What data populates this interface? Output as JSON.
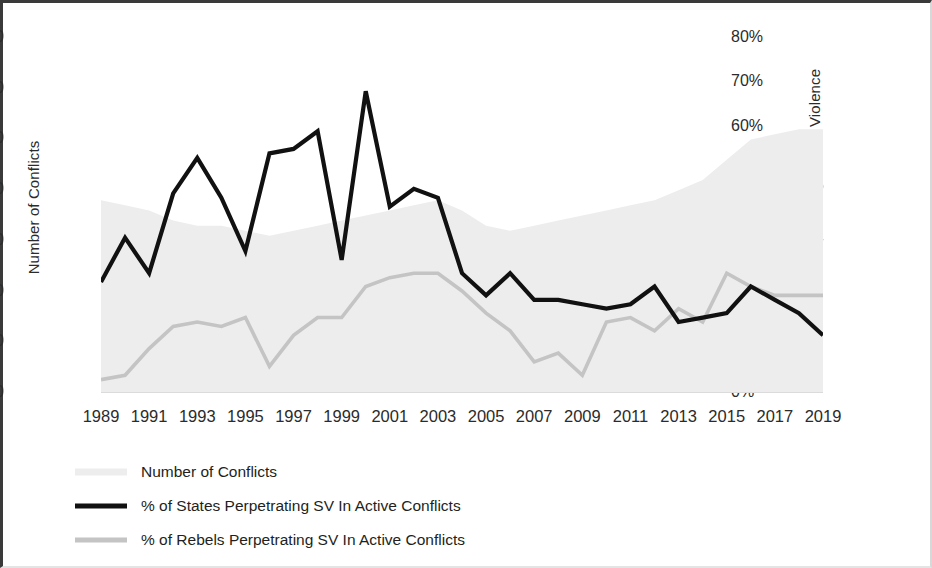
{
  "chart_data": {
    "type": "line",
    "title": "",
    "subtitle": "",
    "xlabel": "",
    "ylabel": "Number of Conflicts",
    "y2label": "% of Actors Perpetrating Sexual Violence",
    "grid": false,
    "legend_position": "bottom-left",
    "x": [
      1989,
      1990,
      1991,
      1992,
      1993,
      1994,
      1995,
      1996,
      1997,
      1998,
      1999,
      2000,
      2001,
      2002,
      2003,
      2004,
      2005,
      2006,
      2007,
      2008,
      2009,
      2010,
      2011,
      2012,
      2013,
      2014,
      2015,
      2016,
      2017,
      2018,
      2019
    ],
    "xticklabels": [
      "1989",
      "1991",
      "1993",
      "1995",
      "1997",
      "1999",
      "2001",
      "2003",
      "2005",
      "2007",
      "2009",
      "2011",
      "2013",
      "2015",
      "2017",
      "2019"
    ],
    "xtickvalues": [
      1989,
      1991,
      1993,
      1995,
      1997,
      1999,
      2001,
      2003,
      2005,
      2007,
      2009,
      2011,
      2013,
      2015,
      2017,
      2019
    ],
    "xlim": [
      1989,
      2019
    ],
    "ylim": [
      0,
      70
    ],
    "yticklabels": [
      "0",
      "10",
      "20",
      "30",
      "40",
      "50",
      "60",
      "70"
    ],
    "ytickvalues": [
      0,
      10,
      20,
      30,
      40,
      50,
      60,
      70
    ],
    "y2lim": [
      0,
      80
    ],
    "y2ticklabels": [
      "0%",
      "10%",
      "20%",
      "30%",
      "40%",
      "50%",
      "60%",
      "70%",
      "80%"
    ],
    "y2tickvalues": [
      0,
      10,
      20,
      30,
      40,
      50,
      60,
      70,
      80
    ],
    "series": [
      {
        "name": "Number of Conflicts",
        "chart_type": "area",
        "axis": "left",
        "color": "#ededed",
        "values": [
          38,
          37,
          36,
          34,
          33,
          33,
          32,
          31,
          32,
          33,
          34,
          35,
          36,
          37,
          38,
          36,
          33,
          32,
          33,
          34,
          35,
          36,
          37,
          38,
          40,
          42,
          46,
          50,
          51,
          52,
          52
        ]
      },
      {
        "name": "% of States Perpetrating SV In Active Conflicts",
        "chart_type": "line",
        "axis": "right",
        "color": "#111111",
        "values": [
          25,
          35,
          27,
          45,
          53,
          44,
          32,
          54,
          55,
          59,
          30,
          68,
          42,
          46,
          44,
          27,
          22,
          27,
          21,
          21,
          20,
          19,
          20,
          24,
          16,
          17,
          18,
          24,
          21,
          18,
          13
        ]
      },
      {
        "name": "% of Rebels Perpetrating SV In Active Conflicts",
        "chart_type": "line",
        "axis": "right",
        "color": "#c4c4c4",
        "values": [
          3,
          4,
          10,
          15,
          16,
          15,
          17,
          6,
          13,
          17,
          17,
          24,
          26,
          27,
          27,
          23,
          18,
          14,
          7,
          9,
          4,
          16,
          17,
          14,
          19,
          16,
          27,
          24,
          22,
          22,
          22
        ]
      }
    ]
  },
  "legend": {
    "items": [
      {
        "label": "Number of Conflicts",
        "swatch": "area-swatch"
      },
      {
        "label": "% of States Perpetrating SV In Active Conflicts",
        "swatch": "states-line-swatch"
      },
      {
        "label": "% of Rebels Perpetrating SV In Active Conflicts",
        "swatch": "rebels-line-swatch"
      }
    ]
  },
  "colors": {
    "area": "#ededed",
    "states_line": "#111111",
    "rebels_line": "#c4c4c4",
    "text": "#231f20",
    "frame": "#3a3a3a"
  }
}
